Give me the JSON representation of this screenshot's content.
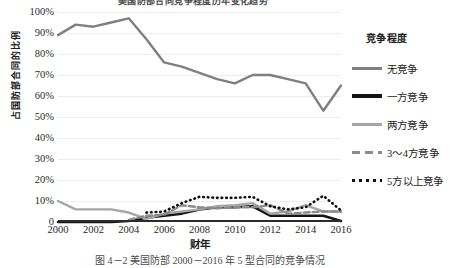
{
  "figure": {
    "top_title": "美国防部合同竞争程度历年变化趋势",
    "caption": "图 4－2 美国防部 2000－2016 年 5 型合同的竞争情况"
  },
  "axes": {
    "y_title": "占国防部合同的比例",
    "x_title": "财年",
    "y_ticks": [
      "100%",
      "90%",
      "80%",
      "70%",
      "60%",
      "50%",
      "40%",
      "30%",
      "20%",
      "10%",
      "0"
    ],
    "x_ticks": [
      "2000",
      "2002",
      "2004",
      "2006",
      "2008",
      "2010",
      "2012",
      "2014",
      "2016"
    ]
  },
  "legend": {
    "title": "竞争程度",
    "items": [
      {
        "label": "无竞争",
        "style": "solid-grey",
        "color": "#7f7f7f"
      },
      {
        "label": "一方竞争",
        "style": "solid-black",
        "color": "#151515"
      },
      {
        "label": "两方竞争",
        "style": "solid-lgrey",
        "color": "#a6a6a6"
      },
      {
        "label": "3～4方竞争",
        "style": "dashed",
        "color": "#8c8c8c"
      },
      {
        "label": "5方以上竞争",
        "style": "dotted",
        "color": "#101010"
      }
    ]
  },
  "chart_data": {
    "type": "line",
    "title": "美国防部合同竞争程度历年变化趋势",
    "xlabel": "财年",
    "ylabel": "占国防部合同的比例",
    "xlim": [
      2000,
      2016
    ],
    "ylim": [
      0,
      100
    ],
    "yunit": "%",
    "grid": true,
    "legend_position": "right",
    "x": [
      2000,
      2001,
      2002,
      2003,
      2004,
      2005,
      2006,
      2007,
      2008,
      2009,
      2010,
      2011,
      2012,
      2013,
      2014,
      2015,
      2016
    ],
    "series": [
      {
        "name": "无竞争",
        "color": "#7f7f7f",
        "style": "solid-grey",
        "values": [
          89,
          94,
          93,
          95,
          97,
          87,
          76,
          74,
          71,
          68,
          66,
          70,
          70,
          68,
          66,
          53,
          65
        ]
      },
      {
        "name": "一方竞争",
        "color": "#151515",
        "style": "solid-black",
        "values": [
          0,
          0,
          0,
          0,
          0.5,
          2,
          3,
          4,
          6,
          7,
          7,
          7.5,
          3,
          3,
          3,
          3,
          0.5
        ]
      },
      {
        "name": "两方竞争",
        "color": "#a6a6a6",
        "style": "solid-lgrey",
        "values": [
          10,
          6,
          6,
          6,
          4.5,
          1.5,
          4,
          5,
          6,
          7.5,
          8,
          9,
          4,
          5,
          8,
          5,
          5
        ]
      },
      {
        "name": "3～4方竞争",
        "color": "#8c8c8c",
        "style": "dashed",
        "values": [
          null,
          null,
          null,
          null,
          1,
          3,
          3.5,
          8,
          7,
          6.5,
          7,
          7,
          8,
          4,
          4.5,
          5,
          5
        ]
      },
      {
        "name": "5方以上竞争",
        "color": "#101010",
        "style": "dotted",
        "values": [
          null,
          null,
          null,
          null,
          null,
          4.5,
          5,
          9,
          12,
          11.5,
          11.5,
          12,
          7.5,
          6,
          7,
          12.5,
          5.5
        ]
      }
    ]
  }
}
